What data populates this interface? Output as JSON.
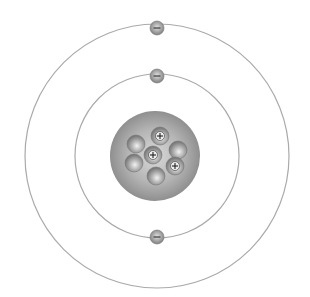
{
  "diagram": {
    "title": "Bohr model of an atom",
    "center": {
      "x": 157,
      "y": 156
    },
    "nucleus": {
      "radius": 45,
      "color": "#9a9a9a",
      "particles": [
        {
          "type": "neutron",
          "x": 136,
          "y": 144
        },
        {
          "type": "proton",
          "x": 160,
          "y": 136,
          "symbol": "+"
        },
        {
          "type": "neutron",
          "x": 178,
          "y": 150
        },
        {
          "type": "proton",
          "x": 153,
          "y": 155,
          "symbol": "+"
        },
        {
          "type": "neutron",
          "x": 134,
          "y": 163
        },
        {
          "type": "proton",
          "x": 175,
          "y": 166,
          "symbol": "+"
        },
        {
          "type": "neutron",
          "x": 156,
          "y": 176
        }
      ]
    },
    "shells": [
      {
        "name": "inner-shell",
        "radius": 82,
        "electrons": [
          {
            "x": 157,
            "y": 76,
            "symbol": "−"
          },
          {
            "x": 157,
            "y": 237,
            "symbol": "−"
          }
        ]
      },
      {
        "name": "outer-shell",
        "radius": 132,
        "electrons": [
          {
            "x": 157,
            "y": 28,
            "symbol": "−"
          }
        ]
      }
    ],
    "colors": {
      "ring": "#aaaaaa",
      "particle": "#8c8c8c",
      "particle_highlight": "#e8e8e8",
      "sign": "#222222"
    }
  }
}
